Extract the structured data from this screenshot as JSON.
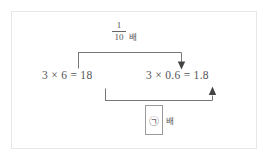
{
  "diagram": {
    "type": "math-relation-diagram",
    "frame": {
      "border_color": "#e6e6e6",
      "background": "#ffffff"
    },
    "line_color": "#777777",
    "top_relation": {
      "label_numerator": "1",
      "label_denominator": "10",
      "label_unit": "배",
      "direction": "left-to-right",
      "arrow": "down-arrow-icon",
      "from": "3 × 6 = 18",
      "to": "3 × 0.6 = 1.8"
    },
    "equations": {
      "left": "3 × 6 = 18",
      "right": "3 × 0.6 = 1.8"
    },
    "bottom_relation": {
      "label_box_value": "㉠",
      "label_unit": "배",
      "direction": "left-to-right",
      "arrow": "up-arrow-icon",
      "from": "3 × 6 = 18",
      "to": "3 × 0.6 = 1.8"
    }
  }
}
